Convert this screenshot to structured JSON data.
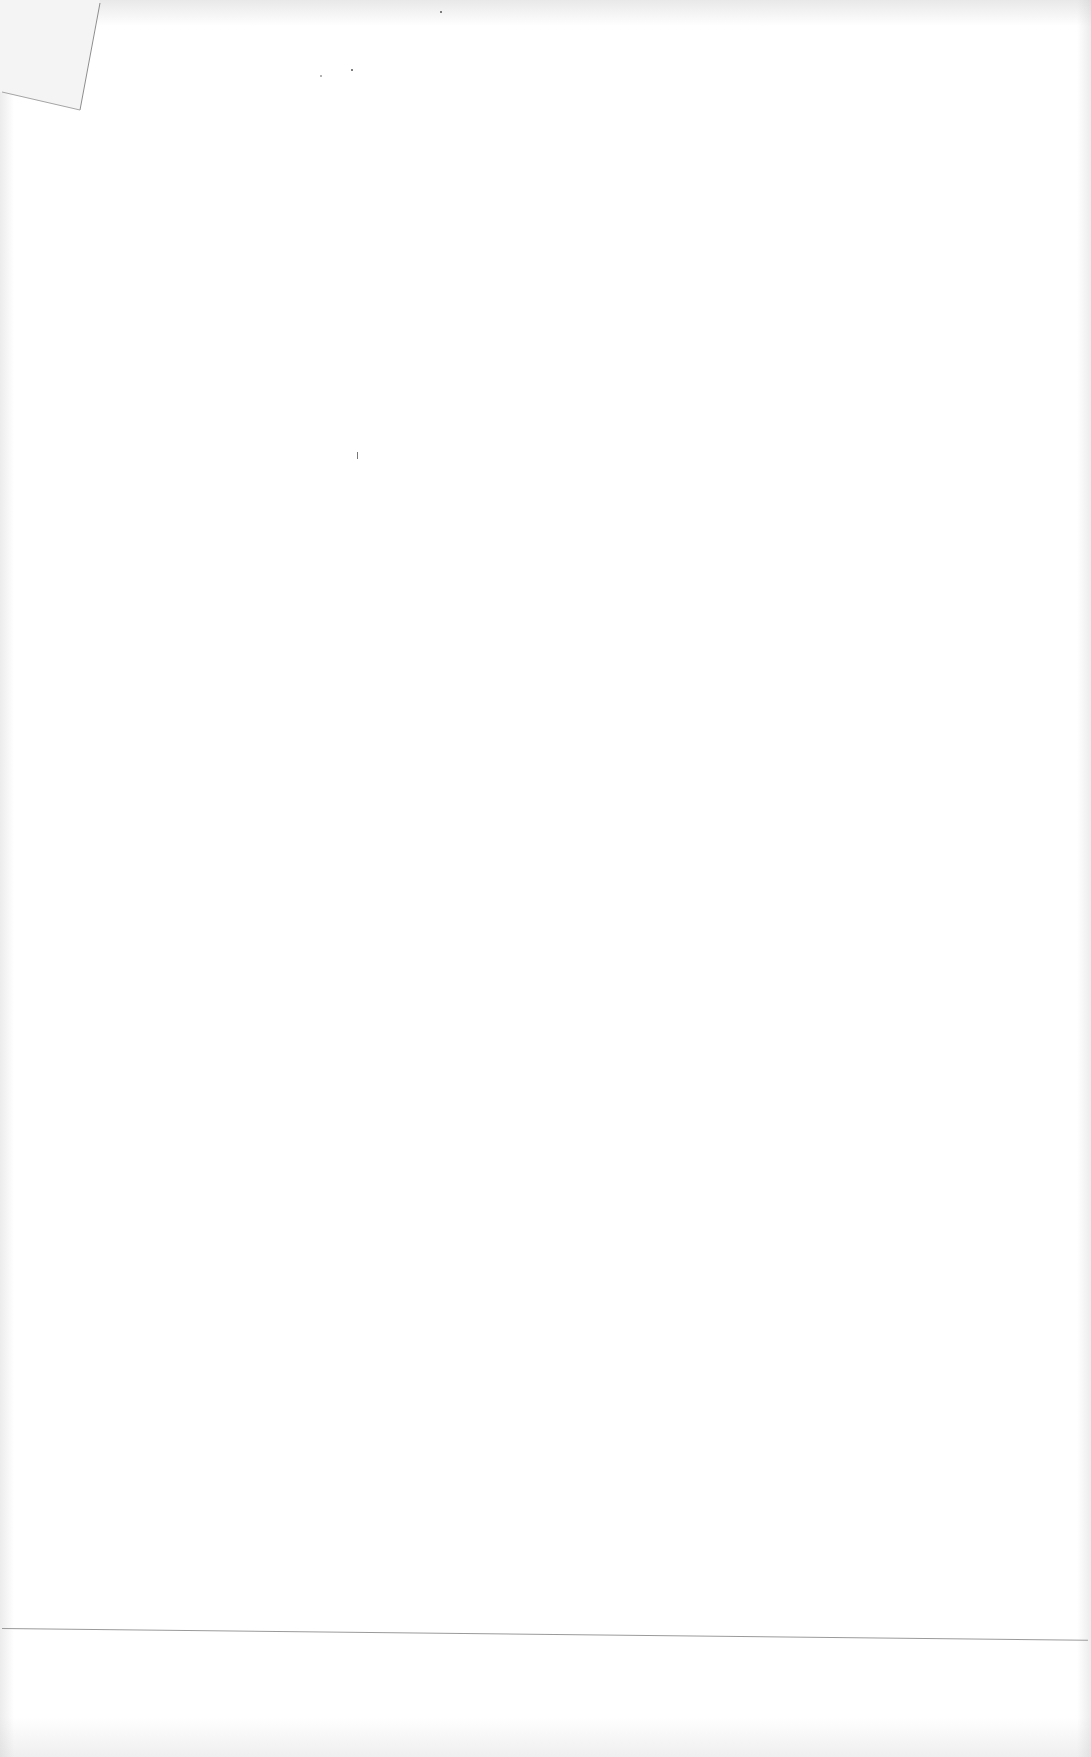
{
  "document": {
    "type": "scanned blank page",
    "text": "",
    "features": {
      "folded_corner": "top-left",
      "horizontal_rule": "near bottom of page",
      "body_content": "none"
    }
  }
}
